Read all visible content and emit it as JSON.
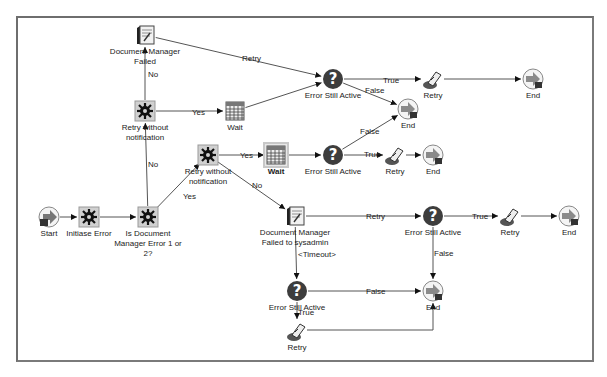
{
  "diagram": {
    "type": "workflow-process",
    "nodes": [
      {
        "id": "doc_mgr_failed",
        "label": "Document Manager\nFailed",
        "kind": "notification",
        "x": 145,
        "y": 35
      },
      {
        "id": "retry_wo_notif_1",
        "label": "Retry without\nnotification",
        "kind": "function",
        "x": 145,
        "y": 111
      },
      {
        "id": "wait_1",
        "label": "Wait",
        "kind": "wait",
        "x": 235,
        "y": 111
      },
      {
        "id": "err_active_1",
        "label": "Error Still Active",
        "kind": "decision",
        "x": 333,
        "y": 79
      },
      {
        "id": "retry_1",
        "label": "Retry",
        "kind": "retry",
        "x": 433,
        "y": 79
      },
      {
        "id": "end_1",
        "label": "End",
        "kind": "end",
        "x": 533,
        "y": 79
      },
      {
        "id": "end_2",
        "label": "End",
        "kind": "end",
        "x": 408,
        "y": 109
      },
      {
        "id": "retry_wo_notif_2",
        "label": "Retry without\nnotification",
        "kind": "function",
        "x": 208,
        "y": 155
      },
      {
        "id": "wait_2",
        "label": "Wait",
        "kind": "wait",
        "x": 276,
        "y": 155,
        "selected": true
      },
      {
        "id": "err_active_2",
        "label": "Error Still Active",
        "kind": "decision",
        "x": 333,
        "y": 155
      },
      {
        "id": "retry_2",
        "label": "Retry",
        "kind": "retry",
        "x": 395,
        "y": 155
      },
      {
        "id": "end_3",
        "label": "End",
        "kind": "end",
        "x": 433,
        "y": 155
      },
      {
        "id": "start",
        "label": "Start",
        "kind": "start",
        "x": 49,
        "y": 217
      },
      {
        "id": "initiate_error",
        "label": "Initiase Error",
        "kind": "function",
        "x": 89,
        "y": 217
      },
      {
        "id": "is_doc_mgr_err",
        "label": "Is Document\nManager Error 1 or\n2?",
        "kind": "function",
        "x": 148,
        "y": 217
      },
      {
        "id": "doc_mgr_failed_sysadmin",
        "label": "Document Manager\nFailed to sysadmin",
        "kind": "notification",
        "x": 295,
        "y": 216
      },
      {
        "id": "err_active_3",
        "label": "Error Still Active",
        "kind": "decision",
        "x": 433,
        "y": 216
      },
      {
        "id": "retry_3",
        "label": "Retry",
        "kind": "retry",
        "x": 510,
        "y": 216
      },
      {
        "id": "end_4",
        "label": "End",
        "kind": "end",
        "x": 569,
        "y": 216
      },
      {
        "id": "err_active_4",
        "label": "Error Still Active",
        "kind": "decision",
        "x": 297,
        "y": 291
      },
      {
        "id": "end_5",
        "label": "End",
        "kind": "end",
        "x": 433,
        "y": 291
      },
      {
        "id": "retry_4",
        "label": "Retry",
        "kind": "retry",
        "x": 297,
        "y": 331
      }
    ],
    "edges": [
      {
        "from": "start",
        "to": "initiate_error",
        "label": ""
      },
      {
        "from": "initiate_error",
        "to": "is_doc_mgr_err",
        "label": ""
      },
      {
        "from": "is_doc_mgr_err",
        "to": "retry_wo_notif_1",
        "label": "No"
      },
      {
        "from": "is_doc_mgr_err",
        "to": "retry_wo_notif_2",
        "label": "Yes"
      },
      {
        "from": "retry_wo_notif_1",
        "to": "doc_mgr_failed",
        "label": "No"
      },
      {
        "from": "retry_wo_notif_1",
        "to": "wait_1",
        "label": "Yes"
      },
      {
        "from": "doc_mgr_failed",
        "to": "err_active_1",
        "label": "Retry"
      },
      {
        "from": "wait_1",
        "to": "err_active_1",
        "label": ""
      },
      {
        "from": "err_active_1",
        "to": "retry_1",
        "label": "True"
      },
      {
        "from": "retry_1",
        "to": "end_1",
        "label": ""
      },
      {
        "from": "err_active_1",
        "to": "end_2",
        "label": "False"
      },
      {
        "from": "retry_wo_notif_2",
        "to": "wait_2",
        "label": "Yes"
      },
      {
        "from": "retry_wo_notif_2",
        "to": "doc_mgr_failed_sysadmin",
        "label": "No"
      },
      {
        "from": "wait_2",
        "to": "err_active_2",
        "label": ""
      },
      {
        "from": "err_active_2",
        "to": "end_2",
        "label": "False"
      },
      {
        "from": "err_active_2",
        "to": "retry_2",
        "label": "True"
      },
      {
        "from": "retry_2",
        "to": "end_3",
        "label": ""
      },
      {
        "from": "doc_mgr_failed_sysadmin",
        "to": "err_active_3",
        "label": "Retry"
      },
      {
        "from": "doc_mgr_failed_sysadmin",
        "to": "err_active_4",
        "label": "<Timeout>"
      },
      {
        "from": "err_active_3",
        "to": "retry_3",
        "label": "True"
      },
      {
        "from": "retry_3",
        "to": "end_4",
        "label": ""
      },
      {
        "from": "err_active_3",
        "to": "end_5",
        "label": "False"
      },
      {
        "from": "err_active_4",
        "to": "end_5",
        "label": "False"
      },
      {
        "from": "err_active_4",
        "to": "retry_4",
        "label": "True"
      },
      {
        "from": "retry_4",
        "to": "end_5",
        "label": ""
      }
    ],
    "edge_label_positions": [
      {
        "text": "Yes",
        "x": 183,
        "y": 197
      },
      {
        "text": "No",
        "x": 148,
        "y": 165
      },
      {
        "text": "No",
        "x": 148,
        "y": 75
      },
      {
        "text": "Yes",
        "x": 192,
        "y": 113
      },
      {
        "text": "Retry",
        "x": 242,
        "y": 59
      },
      {
        "text": "True",
        "x": 383,
        "y": 81
      },
      {
        "text": "False",
        "x": 365,
        "y": 91
      },
      {
        "text": "Yes",
        "x": 240,
        "y": 156
      },
      {
        "text": "No",
        "x": 252,
        "y": 186
      },
      {
        "text": "False",
        "x": 360,
        "y": 132
      },
      {
        "text": "True",
        "x": 364,
        "y": 155
      },
      {
        "text": "Retry",
        "x": 366,
        "y": 217
      },
      {
        "text": "True",
        "x": 472,
        "y": 217
      },
      {
        "text": "False",
        "x": 434,
        "y": 254
      },
      {
        "text": "<Timeout>",
        "x": 298,
        "y": 255
      },
      {
        "text": "False",
        "x": 366,
        "y": 292
      },
      {
        "text": "True",
        "x": 298,
        "y": 313
      }
    ]
  }
}
